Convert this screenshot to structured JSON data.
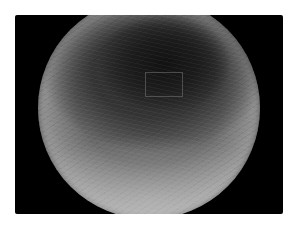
{
  "image": {
    "description": "Grayscale endoscopic view of a lumen with dark central opening and textured mucosa",
    "colors": {
      "background": "#ffffff",
      "frame": "#000000",
      "lumen_dark": "#141414",
      "mucosa_mid": "#6a6a6a",
      "mucosa_light": "#bdbdbd"
    },
    "annotations": [
      {
        "type": "rectangle",
        "label": ""
      }
    ]
  }
}
